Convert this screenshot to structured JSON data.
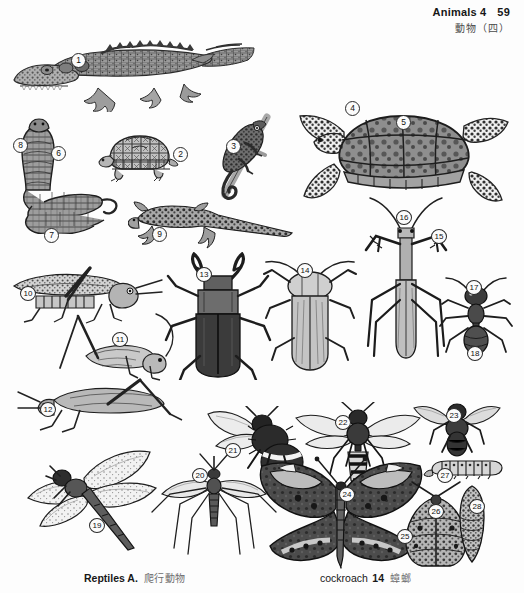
{
  "header": {
    "title_en": "Animals 4",
    "page_number": "59",
    "title_cn": "動物（四）"
  },
  "footer": {
    "left_en": "Reptiles A.",
    "left_cn": "爬行動物",
    "right_en": "cockroach",
    "right_number": "14",
    "right_cn": "蟑螂"
  },
  "plate": {
    "caption": "Numbered grayscale engravings of reptiles and insects",
    "markers": [
      {
        "n": "1",
        "x": 71,
        "y": 35,
        "subject": "crocodile"
      },
      {
        "n": "2",
        "x": 173,
        "y": 129,
        "subject": "box-turtle"
      },
      {
        "n": "3",
        "x": 226,
        "y": 121,
        "subject": "chameleon"
      },
      {
        "n": "4",
        "x": 345,
        "y": 83,
        "subject": "sea-turtle-flipper"
      },
      {
        "n": "5",
        "x": 396,
        "y": 97,
        "subject": "sea-turtle-carapace"
      },
      {
        "n": "6",
        "x": 51,
        "y": 128,
        "subject": "cobra-hood"
      },
      {
        "n": "7",
        "x": 44,
        "y": 210,
        "subject": "snake-coil"
      },
      {
        "n": "8",
        "x": 13,
        "y": 120,
        "subject": "cobra-head"
      },
      {
        "n": "9",
        "x": 152,
        "y": 209,
        "subject": "lizard"
      },
      {
        "n": "10",
        "x": 20,
        "y": 268,
        "subject": "locust"
      },
      {
        "n": "11",
        "x": 112,
        "y": 314,
        "subject": "cricket"
      },
      {
        "n": "12",
        "x": 40,
        "y": 384,
        "subject": "grasshopper"
      },
      {
        "n": "13",
        "x": 196,
        "y": 249,
        "subject": "stag-beetle"
      },
      {
        "n": "14",
        "x": 297,
        "y": 245,
        "subject": "cockroach"
      },
      {
        "n": "15",
        "x": 431,
        "y": 211,
        "subject": "mantis-foreleg"
      },
      {
        "n": "16",
        "x": 396,
        "y": 192,
        "subject": "praying-mantis"
      },
      {
        "n": "17",
        "x": 466,
        "y": 262,
        "subject": "ant-thorax"
      },
      {
        "n": "18",
        "x": 467,
        "y": 328,
        "subject": "ant-abdomen"
      },
      {
        "n": "19",
        "x": 89,
        "y": 500,
        "subject": "dragonfly"
      },
      {
        "n": "20",
        "x": 192,
        "y": 450,
        "subject": "mosquito"
      },
      {
        "n": "21",
        "x": 225,
        "y": 425,
        "subject": "bumblebee"
      },
      {
        "n": "22",
        "x": 335,
        "y": 397,
        "subject": "wasp"
      },
      {
        "n": "23",
        "x": 446,
        "y": 390,
        "subject": "housefly"
      },
      {
        "n": "24",
        "x": 339,
        "y": 469,
        "subject": "butterfly-antenna"
      },
      {
        "n": "25",
        "x": 397,
        "y": 511,
        "subject": "butterfly-wing"
      },
      {
        "n": "26",
        "x": 428,
        "y": 486,
        "subject": "moth"
      },
      {
        "n": "27",
        "x": 437,
        "y": 450,
        "subject": "caterpillar"
      },
      {
        "n": "28",
        "x": 469,
        "y": 481,
        "subject": "chrysalis"
      }
    ]
  },
  "colors": {
    "paper": "#fdfdfd",
    "ink": "#1a1a1a",
    "muted": "#6d6d6d"
  }
}
